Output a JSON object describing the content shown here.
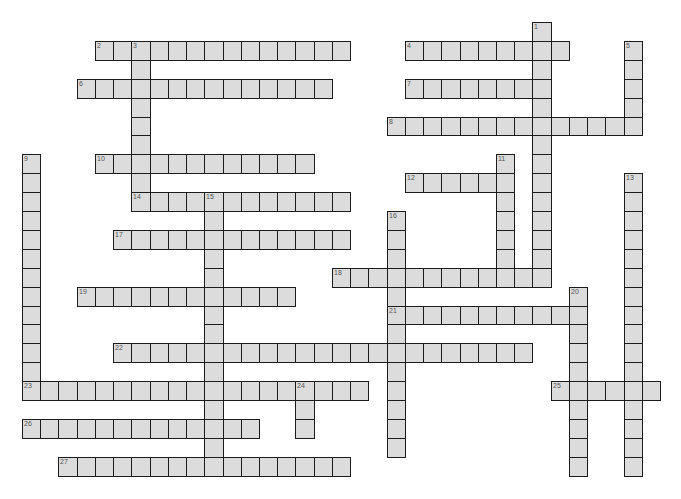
{
  "puzzle": {
    "grid": {
      "origin_x": 22,
      "origin_y": 22,
      "cell_w": 18.23,
      "cell_h": 18.9
    },
    "colors": {
      "cell_fill": "#dcdcdc",
      "cell_border": "#1c1c1c",
      "number": "#555555",
      "background": "#ffffff"
    },
    "entries": [
      {
        "number": "1",
        "direction": "down",
        "row": 0,
        "col": 28,
        "length": 14
      },
      {
        "number": "2",
        "direction": "across",
        "row": 1,
        "col": 4,
        "length": 14
      },
      {
        "number": "3",
        "direction": "down",
        "row": 1,
        "col": 6,
        "length": 9
      },
      {
        "number": "4",
        "direction": "across",
        "row": 1,
        "col": 21,
        "length": 9
      },
      {
        "number": "5",
        "direction": "down",
        "row": 1,
        "col": 33,
        "length": 5
      },
      {
        "number": "6",
        "direction": "across",
        "row": 3,
        "col": 3,
        "length": 14
      },
      {
        "number": "7",
        "direction": "across",
        "row": 3,
        "col": 21,
        "length": 8
      },
      {
        "number": "8",
        "direction": "across",
        "row": 5,
        "col": 20,
        "length": 14
      },
      {
        "number": "9",
        "direction": "down",
        "row": 7,
        "col": 0,
        "length": 13
      },
      {
        "number": "10",
        "direction": "across",
        "row": 7,
        "col": 4,
        "length": 12
      },
      {
        "number": "11",
        "direction": "down",
        "row": 7,
        "col": 26,
        "length": 7
      },
      {
        "number": "12",
        "direction": "across",
        "row": 8,
        "col": 21,
        "length": 6
      },
      {
        "number": "13",
        "direction": "down",
        "row": 8,
        "col": 33,
        "length": 16
      },
      {
        "number": "14",
        "direction": "across",
        "row": 9,
        "col": 6,
        "length": 12
      },
      {
        "number": "15",
        "direction": "down",
        "row": 9,
        "col": 10,
        "length": 15
      },
      {
        "number": "16",
        "direction": "down",
        "row": 10,
        "col": 20,
        "length": 13
      },
      {
        "number": "17",
        "direction": "across",
        "row": 11,
        "col": 5,
        "length": 13
      },
      {
        "number": "18",
        "direction": "across",
        "row": 13,
        "col": 17,
        "length": 12
      },
      {
        "number": "19",
        "direction": "across",
        "row": 14,
        "col": 3,
        "length": 12
      },
      {
        "number": "20",
        "direction": "down",
        "row": 14,
        "col": 30,
        "length": 10
      },
      {
        "number": "21",
        "direction": "across",
        "row": 15,
        "col": 20,
        "length": 11
      },
      {
        "number": "22",
        "direction": "across",
        "row": 17,
        "col": 5,
        "length": 23
      },
      {
        "number": "23",
        "direction": "across",
        "row": 19,
        "col": 0,
        "length": 19
      },
      {
        "number": "24",
        "direction": "down",
        "row": 19,
        "col": 15,
        "length": 3
      },
      {
        "number": "25",
        "direction": "across",
        "row": 19,
        "col": 29,
        "length": 6
      },
      {
        "number": "26",
        "direction": "across",
        "row": 21,
        "col": 0,
        "length": 13
      },
      {
        "number": "27",
        "direction": "across",
        "row": 23,
        "col": 2,
        "length": 16
      }
    ]
  }
}
